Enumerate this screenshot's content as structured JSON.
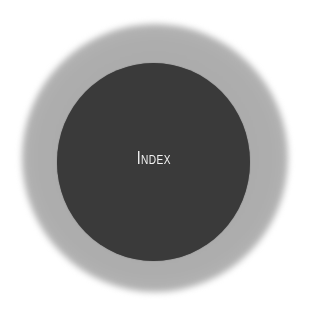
{
  "diagram": {
    "label": "Index",
    "colors": {
      "background": "#ffffff",
      "halo": "#adadad",
      "disc": "#3a3a3a",
      "text": "#f2f2f2"
    }
  }
}
